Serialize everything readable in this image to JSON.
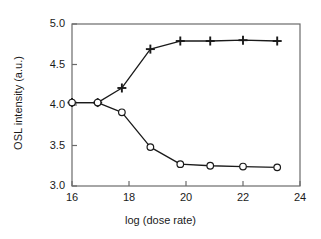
{
  "chart_data": {
    "type": "line",
    "title": "",
    "xlabel": "log (dose rate)",
    "ylabel": "OSL intensity (a.u.)",
    "xlim": [
      16,
      24
    ],
    "ylim": [
      3.0,
      5.0
    ],
    "xticks": [
      16,
      18,
      20,
      22,
      24
    ],
    "xtick_labels": [
      "16",
      "18",
      "20",
      "22",
      "24"
    ],
    "yticks": [
      3.0,
      3.5,
      4.0,
      4.5,
      5.0
    ],
    "ytick_labels": [
      "3.0",
      "3.5",
      "4.0",
      "4.5",
      "5.0"
    ],
    "grid": false,
    "legend": false,
    "legend_position": "none",
    "series": [
      {
        "name": "upper-branch",
        "marker": "plus",
        "color": "#1a1a1a",
        "x": [
          16.0,
          16.9,
          17.75,
          18.75,
          19.8,
          20.85,
          22.0,
          23.2
        ],
        "values": [
          4.03,
          4.03,
          4.21,
          4.69,
          4.79,
          4.79,
          4.8,
          4.79
        ]
      },
      {
        "name": "lower-branch",
        "marker": "circle-open",
        "color": "#1a1a1a",
        "x": [
          16.0,
          16.9,
          17.75,
          18.75,
          19.8,
          20.85,
          22.0,
          23.2
        ],
        "values": [
          4.03,
          4.03,
          3.91,
          3.48,
          3.27,
          3.25,
          3.24,
          3.23
        ]
      }
    ]
  },
  "axes": {
    "frame_color": "#6b6b6b",
    "tick_color": "#6b6b6b"
  }
}
